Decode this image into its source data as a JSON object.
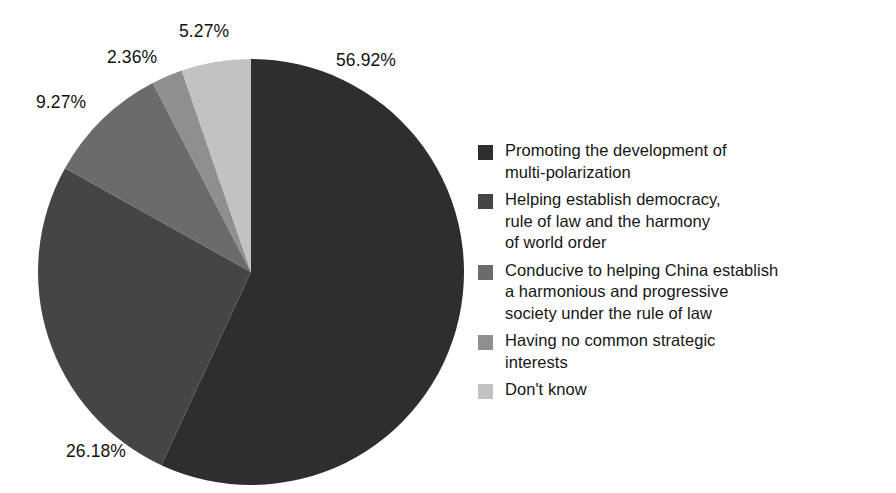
{
  "chart_data": {
    "type": "pie",
    "title": "",
    "subtitle": "",
    "xlabel": "",
    "ylabel": "",
    "grid": false,
    "legend_position": "right",
    "start_angle_deg": 0,
    "direction": "clockwise",
    "units": "percent",
    "categories": [
      "Promoting the development of multi-polarization",
      "Helping establish democracy, rule of law and the harmony of world order",
      "Conducive to helping China establish a harmonious and progressive society under the rule of law",
      "Having no common strategic interests",
      "Don't know"
    ],
    "values": [
      56.92,
      26.18,
      9.27,
      2.36,
      5.27
    ],
    "data_labels": [
      "56.92%",
      "26.18%",
      "9.27%",
      "2.36%",
      "5.27%"
    ],
    "colors": [
      "#2e2e2e",
      "#454545",
      "#6b6b6b",
      "#8f8f8f",
      "#c2c2c2"
    ],
    "legend_entries": [
      "Promoting the development of\nmulti-polarization",
      "Helping establish democracy,\nrule of law and the harmony\nof world order",
      "Conducive to helping China establish\na harmonious and progressive\nsociety under the rule of law",
      "Having no common strategic\ninterests",
      "Don't know"
    ]
  },
  "background_color": "#ffffff",
  "text_color": "#121212"
}
